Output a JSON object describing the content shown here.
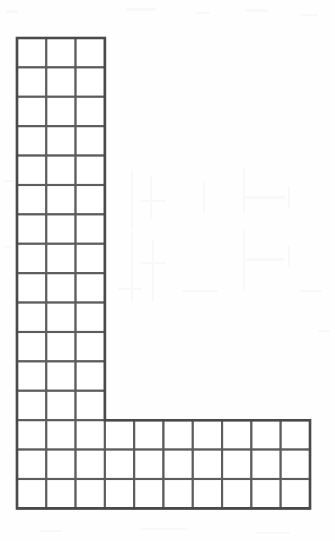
{
  "document": {
    "type": "scanned-worksheet-figure",
    "title": "L-shaped grid figure",
    "background_color": "#fefefe",
    "grid_line_color": "#5d5d5d",
    "outline_color": "#4a4a4a",
    "cell_fill_color": "#ffffff"
  },
  "figure": {
    "name": "l-shaped-polyomino-grid",
    "origin_x": 17,
    "origin_y": 38,
    "cell_width": 29.3,
    "cell_height": 29.4,
    "stem": {
      "label": "vertical-stem",
      "columns": 3,
      "rows": 16
    },
    "foot": {
      "label": "horizontal-foot",
      "columns": 10,
      "rows": 3,
      "rows_start_index": 13,
      "extension_columns": 7
    },
    "totals": {
      "stem_only_cells": 39,
      "foot_cells": 30,
      "total_cells": 69
    }
  },
  "chart_data": {
    "type": "heatmap",
    "xlabel": "",
    "ylabel": "",
    "columns": 10,
    "rows": 16,
    "cell_size": 1,
    "filled_label": "unit square",
    "empty_label": "blank",
    "cells": [
      [
        1,
        1,
        1,
        0,
        0,
        0,
        0,
        0,
        0,
        0
      ],
      [
        1,
        1,
        1,
        0,
        0,
        0,
        0,
        0,
        0,
        0
      ],
      [
        1,
        1,
        1,
        0,
        0,
        0,
        0,
        0,
        0,
        0
      ],
      [
        1,
        1,
        1,
        0,
        0,
        0,
        0,
        0,
        0,
        0
      ],
      [
        1,
        1,
        1,
        0,
        0,
        0,
        0,
        0,
        0,
        0
      ],
      [
        1,
        1,
        1,
        0,
        0,
        0,
        0,
        0,
        0,
        0
      ],
      [
        1,
        1,
        1,
        0,
        0,
        0,
        0,
        0,
        0,
        0
      ],
      [
        1,
        1,
        1,
        0,
        0,
        0,
        0,
        0,
        0,
        0
      ],
      [
        1,
        1,
        1,
        0,
        0,
        0,
        0,
        0,
        0,
        0
      ],
      [
        1,
        1,
        1,
        0,
        0,
        0,
        0,
        0,
        0,
        0
      ],
      [
        1,
        1,
        1,
        0,
        0,
        0,
        0,
        0,
        0,
        0
      ],
      [
        1,
        1,
        1,
        0,
        0,
        0,
        0,
        0,
        0,
        0
      ],
      [
        1,
        1,
        1,
        0,
        0,
        0,
        0,
        0,
        0,
        0
      ],
      [
        1,
        1,
        1,
        1,
        1,
        1,
        1,
        1,
        1,
        1
      ],
      [
        1,
        1,
        1,
        1,
        1,
        1,
        1,
        1,
        1,
        1
      ],
      [
        1,
        1,
        1,
        1,
        1,
        1,
        1,
        1,
        1,
        1
      ]
    ]
  },
  "noise": {
    "smudges": [
      {
        "x": 6,
        "y": 10,
        "w": 12,
        "h": 3
      },
      {
        "x": 126,
        "y": 8,
        "w": 30,
        "h": 3
      },
      {
        "x": 196,
        "y": 12,
        "w": 14,
        "h": 2
      },
      {
        "x": 246,
        "y": 9,
        "w": 22,
        "h": 3
      },
      {
        "x": 300,
        "y": 14,
        "w": 18,
        "h": 2
      },
      {
        "x": 131,
        "y": 170,
        "w": 2,
        "h": 60
      },
      {
        "x": 150,
        "y": 176,
        "w": 2,
        "h": 44
      },
      {
        "x": 203,
        "y": 182,
        "w": 2,
        "h": 30
      },
      {
        "x": 243,
        "y": 168,
        "w": 2,
        "h": 44
      },
      {
        "x": 245,
        "y": 196,
        "w": 40,
        "h": 3
      },
      {
        "x": 131,
        "y": 232,
        "w": 2,
        "h": 70
      },
      {
        "x": 152,
        "y": 240,
        "w": 2,
        "h": 62
      },
      {
        "x": 243,
        "y": 230,
        "w": 2,
        "h": 60
      },
      {
        "x": 246,
        "y": 258,
        "w": 38,
        "h": 3
      },
      {
        "x": 288,
        "y": 186,
        "w": 2,
        "h": 22
      },
      {
        "x": 288,
        "y": 246,
        "w": 2,
        "h": 22
      },
      {
        "x": 4,
        "y": 180,
        "w": 10,
        "h": 2
      },
      {
        "x": 4,
        "y": 246,
        "w": 8,
        "h": 2
      },
      {
        "x": 140,
        "y": 262,
        "w": 26,
        "h": 2
      },
      {
        "x": 140,
        "y": 200,
        "w": 26,
        "h": 2
      },
      {
        "x": 118,
        "y": 288,
        "w": 24,
        "h": 2
      },
      {
        "x": 182,
        "y": 290,
        "w": 36,
        "h": 2
      },
      {
        "x": 300,
        "y": 290,
        "w": 22,
        "h": 2
      },
      {
        "x": 150,
        "y": 450,
        "w": 2,
        "h": 10
      },
      {
        "x": 318,
        "y": 330,
        "w": 12,
        "h": 2
      },
      {
        "x": 40,
        "y": 530,
        "w": 22,
        "h": 2
      },
      {
        "x": 140,
        "y": 528,
        "w": 48,
        "h": 2
      },
      {
        "x": 256,
        "y": 532,
        "w": 34,
        "h": 2
      }
    ]
  }
}
